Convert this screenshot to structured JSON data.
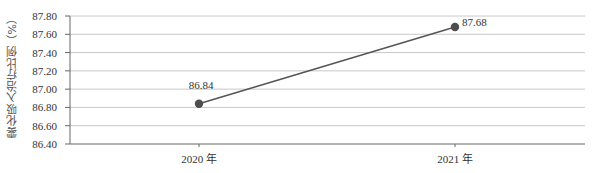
{
  "chart_data": {
    "type": "line",
    "title": "",
    "xlabel": "",
    "ylabel": "雾化吸入治疗比例（%）",
    "categories": [
      "2020 年",
      "2021 年"
    ],
    "series": [
      {
        "name": "雾化吸入治疗比例",
        "values": [
          86.84,
          87.68
        ],
        "color": "#555555"
      }
    ],
    "data_labels": [
      "86.84",
      "87.68"
    ],
    "ylim": [
      86.4,
      87.8
    ],
    "yticks": [
      86.4,
      86.6,
      86.8,
      87.0,
      87.2,
      87.4,
      87.6,
      87.8
    ],
    "ytick_labels": [
      "86.40",
      "86.60",
      "86.80",
      "87.00",
      "87.20",
      "87.40",
      "87.60",
      "87.80"
    ],
    "grid": true,
    "legend": "none"
  },
  "colors": {
    "line": "#555555",
    "marker": "#4d4d4d",
    "grid": "#c8c8c8",
    "axis": "#666666",
    "text": "#333333"
  }
}
